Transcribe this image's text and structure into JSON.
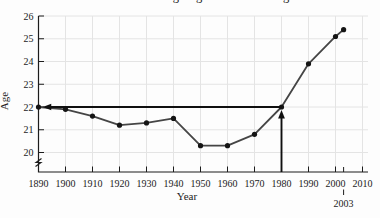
{
  "figure": {
    "background": "#fdfdfd"
  },
  "chart_data": {
    "type": "line",
    "title": "Average Age at First Marriage",
    "title_visibility": "cropped by top edge; only letter descenders visible",
    "xlabel": "Year",
    "ylabel": "Age",
    "x": [
      1890,
      1900,
      1910,
      1920,
      1930,
      1940,
      1950,
      1960,
      1970,
      1980,
      1990,
      2000,
      2003
    ],
    "y": [
      22.0,
      21.9,
      21.6,
      21.2,
      21.3,
      21.5,
      20.3,
      20.3,
      20.8,
      22.0,
      23.9,
      25.1,
      25.4
    ],
    "x_ticks": [
      1890,
      1900,
      1910,
      1920,
      1930,
      1940,
      1950,
      1960,
      1970,
      1980,
      1990,
      2000,
      2010
    ],
    "x_tick_labels": [
      "1890",
      "1900",
      "1910",
      "1920",
      "1930",
      "1940",
      "1950",
      "1960",
      "1970",
      "1980",
      "1990",
      "2000",
      "2010"
    ],
    "y_ticks": [
      20,
      21,
      22,
      23,
      24,
      25,
      26
    ],
    "y_tick_labels": [
      "20",
      "21",
      "22",
      "23",
      "24",
      "25",
      "26"
    ],
    "xlim": [
      1890,
      2010
    ],
    "ylim": [
      20,
      26
    ],
    "y_axis_break": true,
    "grid": true,
    "legend": "none",
    "callout": {
      "year": 2003,
      "label": "2003"
    },
    "annotations": [
      {
        "id": "age-22-reference-arrow",
        "shape": "horizontal-line-with-left-arrowhead",
        "y": 22,
        "from_x": 1980,
        "to_x": 1892.5
      },
      {
        "id": "year-1980-arrow",
        "shape": "vertical-arrow-up-from-x-axis",
        "x": 1980,
        "to_y": 22
      }
    ],
    "colors": {
      "line": "#454545",
      "point": "#151515",
      "axis": "#1c1c1c",
      "grid": "#e4e4e4",
      "annotation": "#101010",
      "text": "#222222"
    }
  }
}
